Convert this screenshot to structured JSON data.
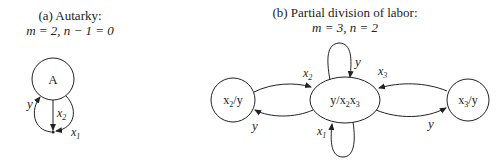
{
  "panel_a": {
    "title": "(a) Autarky:",
    "subtitle": "m = 2, n − 1 = 0",
    "node": {
      "label": "A"
    },
    "edges": [
      {
        "label": "y",
        "sub": ""
      },
      {
        "label": "x",
        "sub": "2"
      },
      {
        "label": "x",
        "sub": "1"
      }
    ]
  },
  "panel_b": {
    "title": "(b) Partial division of labor:",
    "subtitle": "m = 3, n = 2",
    "nodes": {
      "left": {
        "label": "x",
        "sub": "2",
        "suffix": "/y"
      },
      "center": {
        "prefix": "y/x",
        "sub1": "2",
        "mid": "x",
        "sub2": "3"
      },
      "right": {
        "label": "x",
        "sub": "3",
        "suffix": "/y"
      }
    },
    "edges": {
      "top_loop": {
        "label": "y"
      },
      "bottom_loop": {
        "label": "x",
        "sub": "1"
      },
      "left_to_center": {
        "label": "x",
        "sub": "2"
      },
      "center_to_left": {
        "label": "y"
      },
      "right_to_center": {
        "label": "x",
        "sub": "3"
      },
      "center_to_right": {
        "label": "y"
      }
    }
  },
  "colors": {
    "stroke": "#222222",
    "background": "#ffffff"
  }
}
